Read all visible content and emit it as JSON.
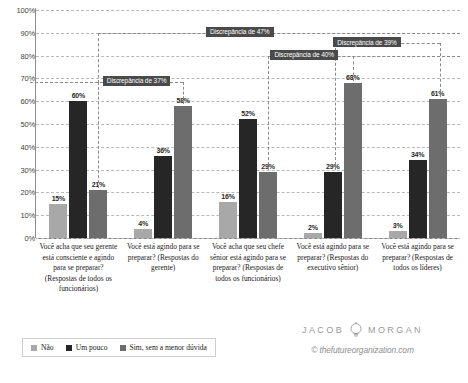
{
  "chart_data": {
    "type": "bar",
    "title": "",
    "subtitle": "",
    "xlabel": "",
    "ylabel": "",
    "ylim": [
      0,
      100
    ],
    "grid": true,
    "legend_position": "bottom-left",
    "ytick_labels": [
      "100%",
      "90%",
      "80%",
      "70%",
      "60%",
      "50%",
      "40%",
      "30%",
      "20%",
      "10%",
      "0%"
    ],
    "ytick_values": [
      100,
      90,
      80,
      70,
      60,
      50,
      40,
      30,
      20,
      10,
      0
    ],
    "categories": [
      "Você acha que seu gerente está consciente e agindo para se preparar? (Respostas de todos os funcionários)",
      "Você está agindo para se preparar? (Respostas do gerente)",
      "Você acha que seu chefe sênior está agindo para se preparar? (Respostas de todos os funcionários)",
      "Você está agindo para se preparar? (Respostas do executivo sênior)",
      "Você está agindo para se preparar? (Respostas de todos os líderes)"
    ],
    "series": [
      {
        "name": "Não",
        "color": "#a8a8a8",
        "values": [
          15,
          4,
          16,
          2,
          3
        ],
        "labels": [
          "15%",
          "4%",
          "16%",
          "2%",
          "3%"
        ]
      },
      {
        "name": "Um pouco",
        "color": "#262626",
        "values": [
          60,
          36,
          52,
          29,
          34
        ],
        "labels": [
          "60%",
          "36%",
          "52%",
          "29%",
          "34%"
        ]
      },
      {
        "name": "Sim, sem a menor dúvida",
        "color": "#6d6d6d",
        "values": [
          21,
          58,
          29,
          68,
          61
        ],
        "labels": [
          "21%",
          "58%",
          "29%",
          "68%",
          "61%"
        ]
      }
    ],
    "annotations": [
      {
        "text": "Discrepância de 47%",
        "value": 47
      },
      {
        "text": "Discrepância de 40%",
        "value": 40
      },
      {
        "text": "Discrepância de 37%",
        "value": 37
      },
      {
        "text": "Discrepância de 39%",
        "value": 39
      }
    ]
  },
  "legend": {
    "items": [
      {
        "label": "Não"
      },
      {
        "label": "Um pouco"
      },
      {
        "label": "Sim, sem a menor dúvida"
      }
    ]
  },
  "branding": {
    "first_name": "JACOB",
    "last_name": "MORGAN",
    "url": "© thefutureorganization.com",
    "logo": "lightbulb-icon"
  }
}
